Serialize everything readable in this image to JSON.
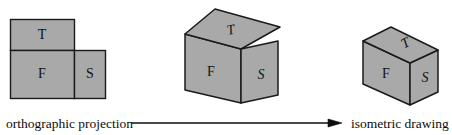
{
  "figure": {
    "fill_color": "#a9a9a9",
    "stroke_color": "#1a1a1a",
    "background_color": "#ffffff",
    "orthographic": {
      "name": "orthographic projection",
      "faces": [
        {
          "key": "top",
          "label": "T",
          "style": "upright"
        },
        {
          "key": "front",
          "label": "F",
          "style": "upright"
        },
        {
          "key": "side",
          "label": "S",
          "style": "upright"
        }
      ]
    },
    "unfolded": {
      "name": "partially folded box",
      "faces": [
        {
          "key": "top",
          "label": "T",
          "style": "italic"
        },
        {
          "key": "front",
          "label": "F",
          "style": "upright"
        },
        {
          "key": "side",
          "label": "S",
          "style": "italic"
        }
      ]
    },
    "isometric": {
      "name": "isometric drawing",
      "faces": [
        {
          "key": "top",
          "label": "T",
          "style": "italic"
        },
        {
          "key": "front",
          "label": "F",
          "style": "upright"
        },
        {
          "key": "side",
          "label": "S",
          "style": "italic"
        }
      ]
    },
    "caption": {
      "left_label": "orthographic projection",
      "right_label": "isometric drawing",
      "arrow_direction": "right"
    }
  }
}
